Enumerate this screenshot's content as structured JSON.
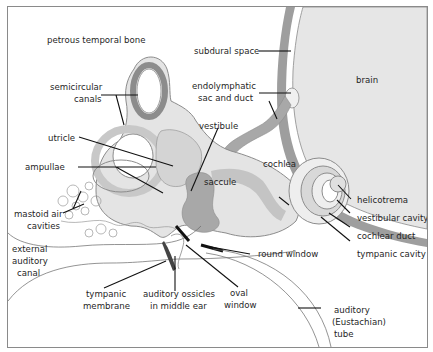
{
  "diagram": {
    "colors": {
      "background": "#ffffff",
      "frame": "#8a8a8a",
      "brain": "#e6e6e6",
      "subdural_band": "#9e9e9e",
      "bone_light": "#f7f7f7",
      "labyrinth_fill": "#d4d4d4",
      "labyrinth_outline": "#8c8c8c",
      "saccule_dark": "#a8a8a8",
      "leader_line": "#111111"
    },
    "labels": {
      "petrous_temporal_bone": "petrous temporal bone",
      "subdural_space": "subdural space",
      "brain": "brain",
      "semicircular_canals_1": "semicircular",
      "semicircular_canals_2": "canals",
      "endolymphatic_1": "endolymphatic",
      "endolymphatic_2": "sac and duct",
      "utricle": "utricle",
      "vestibule": "vestibule",
      "ampullae": "ampullae",
      "saccule": "saccule",
      "cochlea": "cochlea",
      "helicotrema": "helicotrema",
      "vestibular_cavity": "vestibular cavity",
      "cochlear_duct": "cochlear duct",
      "tympanic_cavity": "tympanic cavity",
      "mastoid_1": "mastoid air",
      "mastoid_2": "cavities",
      "round_window": "round window",
      "external_1": "external",
      "external_2": "auditory",
      "external_3": "canal",
      "tympanic_membrane_1": "tympanic",
      "tympanic_membrane_2": "membrane",
      "ossicles_1": "auditory ossicles",
      "ossicles_2": "in middle ear",
      "oval_window_1": "oval",
      "oval_window_2": "window",
      "eustachian_1": "auditory",
      "eustachian_2": "(Eustachian)",
      "eustachian_3": "tube"
    }
  }
}
